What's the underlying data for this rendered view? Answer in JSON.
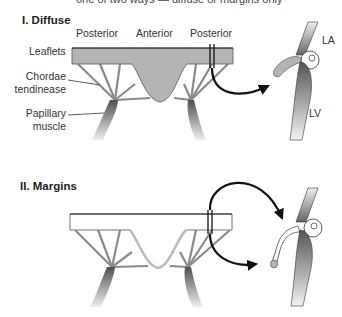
{
  "caption": "one of two ways — diffuse or margins only",
  "sections": [
    {
      "title": "I.  Diffuse",
      "labels": {
        "posterior_left": "Posterior",
        "anterior": "Anterior",
        "posterior_right": "Posterior",
        "leaflets": "Leaflets",
        "chordae_line1": "Chordae",
        "chordae_line2": "tendinease",
        "papillary_line1": "Papillary",
        "papillary_line2": "muscle",
        "la": "LA",
        "lv": "LV"
      }
    },
    {
      "title": "II.  Margins"
    }
  ],
  "colors": {
    "leaflet_fill": "#b4b4b4",
    "muscle_dark": "#5a5a5a",
    "muscle_light": "#e8e8e8",
    "line": "#111111",
    "chord": "#8a8a8a"
  }
}
